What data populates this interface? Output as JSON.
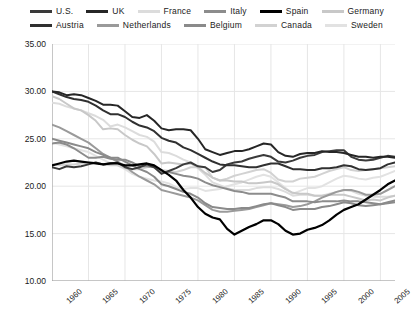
{
  "chart_data": {
    "type": "line",
    "title": "",
    "xlabel": "",
    "ylabel": "Hours per Week per Person",
    "xlim": [
      1960,
      2007
    ],
    "ylim": [
      10,
      35
    ],
    "ytick_labels": [
      "35.00",
      "30.00",
      "25.00",
      "20.00",
      "15.00",
      "10.00"
    ],
    "yticks": [
      35,
      30,
      25,
      20,
      15,
      10
    ],
    "xtick_labels": [
      "1960",
      "1965",
      "1970",
      "1975",
      "1980",
      "1985",
      "1990",
      "1995",
      "2000",
      "2005"
    ],
    "xticks": [
      1960,
      1965,
      1970,
      1975,
      1980,
      1985,
      1990,
      1995,
      2000,
      2005
    ],
    "grid": true,
    "legend_position": "top",
    "x": [
      1960,
      1961,
      1962,
      1963,
      1964,
      1965,
      1966,
      1967,
      1968,
      1969,
      1970,
      1971,
      1972,
      1973,
      1974,
      1975,
      1976,
      1977,
      1978,
      1979,
      1980,
      1981,
      1982,
      1983,
      1984,
      1985,
      1986,
      1987,
      1988,
      1989,
      1990,
      1991,
      1992,
      1993,
      1994,
      1995,
      1996,
      1997,
      1998,
      1999,
      2000,
      2001,
      2002,
      2003,
      2004,
      2005,
      2006,
      2007
    ],
    "series": [
      {
        "name": "U.S.",
        "color": "#3a3a3a",
        "width": 2.0,
        "values": [
          22.0,
          21.8,
          22.1,
          22.0,
          22.1,
          22.3,
          22.5,
          22.3,
          22.4,
          22.5,
          22.0,
          21.8,
          22.0,
          22.3,
          22.0,
          21.3,
          21.6,
          21.9,
          22.3,
          22.5,
          22.1,
          22.0,
          21.5,
          21.7,
          22.3,
          22.5,
          22.6,
          22.9,
          23.1,
          23.3,
          23.1,
          22.6,
          22.5,
          22.7,
          23.0,
          23.2,
          23.3,
          23.6,
          23.7,
          23.8,
          23.8,
          23.1,
          22.8,
          22.7,
          22.8,
          23.0,
          23.2,
          23.1
        ]
      },
      {
        "name": "UK",
        "color": "#262626",
        "width": 2.0,
        "values": [
          30.0,
          29.9,
          29.6,
          29.7,
          29.6,
          29.3,
          29.0,
          28.6,
          28.6,
          28.5,
          27.9,
          27.3,
          27.2,
          27.5,
          26.9,
          26.1,
          25.9,
          26.0,
          26.0,
          25.9,
          25.0,
          23.9,
          23.6,
          23.3,
          23.5,
          23.7,
          23.7,
          23.9,
          24.2,
          24.5,
          24.4,
          23.6,
          23.2,
          23.1,
          23.4,
          23.5,
          23.5,
          23.7,
          23.6,
          23.6,
          23.5,
          23.3,
          23.1,
          23.1,
          23.0,
          23.1,
          23.1,
          23.0
        ]
      },
      {
        "name": "France",
        "color": "#dcdcdc",
        "width": 2.0,
        "values": [
          28.8,
          28.7,
          28.4,
          28.2,
          28.0,
          27.7,
          27.4,
          27.0,
          26.3,
          26.5,
          26.2,
          25.8,
          25.4,
          25.2,
          24.7,
          23.6,
          23.5,
          23.2,
          22.8,
          22.5,
          21.9,
          21.2,
          20.4,
          20.1,
          19.8,
          19.6,
          19.6,
          19.6,
          19.8,
          19.9,
          19.9,
          19.7,
          19.4,
          19.0,
          19.1,
          19.1,
          19.0,
          19.0,
          19.2,
          19.4,
          19.6,
          19.5,
          19.2,
          19.0,
          18.9,
          18.9,
          18.9,
          19.0
        ]
      },
      {
        "name": "Italy",
        "color": "#8c8c8c",
        "width": 2.0,
        "values": [
          24.5,
          24.6,
          24.4,
          24.0,
          23.5,
          23.0,
          23.0,
          23.1,
          22.9,
          22.8,
          22.8,
          22.5,
          22.1,
          22.1,
          22.0,
          21.5,
          21.5,
          21.3,
          21.1,
          21.0,
          20.8,
          20.4,
          20.1,
          19.9,
          19.7,
          19.5,
          19.4,
          19.2,
          19.2,
          19.2,
          19.2,
          19.0,
          18.8,
          18.4,
          18.4,
          18.4,
          18.3,
          18.4,
          18.4,
          18.4,
          18.5,
          18.4,
          18.4,
          18.3,
          18.2,
          18.1,
          18.2,
          18.3
        ]
      },
      {
        "name": "Spain",
        "color": "#000000",
        "width": 2.2,
        "values": [
          22.2,
          22.4,
          22.6,
          22.7,
          22.6,
          22.5,
          22.4,
          22.3,
          22.4,
          22.4,
          22.2,
          22.2,
          22.3,
          22.4,
          22.2,
          21.7,
          21.2,
          20.6,
          19.6,
          18.8,
          17.8,
          17.1,
          16.7,
          16.5,
          15.5,
          14.9,
          15.3,
          15.7,
          16.0,
          16.4,
          16.4,
          16.0,
          15.3,
          14.9,
          15.0,
          15.4,
          15.6,
          15.9,
          16.4,
          17.0,
          17.5,
          17.8,
          18.1,
          18.6,
          19.1,
          19.6,
          20.2,
          20.6
        ]
      },
      {
        "name": "Germany",
        "color": "#c8c8c8",
        "width": 2.0,
        "values": [
          29.5,
          29.2,
          28.7,
          28.2,
          28.0,
          27.5,
          26.9,
          26.0,
          26.1,
          26.0,
          25.4,
          24.9,
          24.5,
          24.2,
          23.4,
          22.4,
          22.5,
          22.4,
          22.3,
          22.4,
          22.0,
          21.4,
          20.9,
          20.6,
          20.6,
          20.5,
          20.5,
          20.3,
          20.3,
          20.4,
          20.5,
          20.2,
          19.7,
          19.3,
          19.2,
          19.2,
          19.0,
          19.0,
          19.1,
          19.1,
          19.1,
          18.9,
          18.7,
          18.5,
          18.6,
          18.5,
          18.8,
          19.0
        ]
      },
      {
        "name": "Austria",
        "color": "#303030",
        "width": 2.0,
        "values": [
          30.0,
          29.7,
          29.4,
          29.2,
          29.1,
          28.9,
          28.5,
          28.0,
          27.6,
          27.6,
          27.3,
          26.8,
          26.4,
          26.2,
          25.8,
          25.1,
          24.8,
          24.6,
          24.1,
          23.8,
          23.4,
          23.0,
          22.6,
          22.3,
          22.2,
          22.2,
          22.1,
          22.0,
          22.0,
          22.2,
          22.4,
          22.4,
          22.1,
          21.8,
          21.8,
          21.7,
          21.7,
          21.9,
          21.9,
          22.0,
          22.2,
          22.1,
          21.8,
          21.7,
          21.8,
          21.9,
          22.3,
          22.5
        ]
      },
      {
        "name": "Netherlands",
        "color": "#9a9a9a",
        "width": 2.0,
        "values": [
          26.5,
          26.2,
          25.8,
          25.4,
          25.0,
          24.6,
          24.0,
          23.4,
          23.0,
          22.6,
          22.1,
          21.5,
          21.0,
          20.6,
          20.2,
          19.6,
          19.4,
          19.2,
          19.0,
          18.8,
          18.5,
          18.0,
          17.5,
          17.3,
          17.3,
          17.4,
          17.5,
          17.6,
          17.8,
          18.0,
          18.2,
          18.1,
          18.0,
          17.8,
          17.9,
          18.1,
          18.4,
          18.8,
          19.1,
          19.4,
          19.6,
          19.6,
          19.4,
          19.1,
          19.1,
          19.2,
          19.6,
          20.0
        ]
      },
      {
        "name": "Belgium",
        "color": "#8a8a8a",
        "width": 2.0,
        "values": [
          25.0,
          24.8,
          24.6,
          24.4,
          24.2,
          24.0,
          23.6,
          23.3,
          23.0,
          23.0,
          22.6,
          22.2,
          21.8,
          21.5,
          21.0,
          20.2,
          20.0,
          19.7,
          19.4,
          19.2,
          18.8,
          18.2,
          17.8,
          17.7,
          17.6,
          17.6,
          17.7,
          17.7,
          17.9,
          18.1,
          18.2,
          18.0,
          17.8,
          17.5,
          17.6,
          17.6,
          17.6,
          17.8,
          17.9,
          18.1,
          18.3,
          18.2,
          18.0,
          17.9,
          18.0,
          18.1,
          18.3,
          18.5
        ]
      },
      {
        "name": "Canada",
        "color": "#d2d2d2",
        "width": 2.0,
        "values": [
          22.3,
          22.2,
          22.3,
          22.3,
          22.4,
          22.5,
          22.5,
          22.3,
          22.2,
          22.2,
          21.9,
          21.8,
          21.8,
          22.0,
          22.1,
          21.7,
          21.6,
          21.5,
          21.7,
          22.0,
          22.0,
          22.0,
          20.9,
          20.6,
          20.8,
          21.1,
          21.3,
          21.5,
          21.7,
          21.8,
          21.4,
          20.7,
          20.5,
          20.5,
          20.8,
          20.9,
          21.0,
          21.3,
          21.6,
          21.8,
          22.0,
          21.7,
          21.6,
          21.7,
          21.8,
          21.9,
          22.0,
          22.1
        ]
      },
      {
        "name": "Sweden",
        "color": "#e2e2e2",
        "width": 2.0,
        "values": [
          24.6,
          24.4,
          24.2,
          24.0,
          23.8,
          23.6,
          23.2,
          22.8,
          22.4,
          22.2,
          21.8,
          21.3,
          21.0,
          20.8,
          20.6,
          20.5,
          20.3,
          19.9,
          19.7,
          19.8,
          19.8,
          19.5,
          19.6,
          19.7,
          20.0,
          20.2,
          20.4,
          20.7,
          21.0,
          21.2,
          21.0,
          20.4,
          19.8,
          19.2,
          19.5,
          19.8,
          19.8,
          20.0,
          20.4,
          20.8,
          21.1,
          21.0,
          20.8,
          20.7,
          20.9,
          21.0,
          21.3,
          21.6
        ]
      }
    ]
  },
  "legend": {
    "rows": [
      [
        {
          "label": "U.S.",
          "color": "#3a3a3a"
        },
        {
          "label": "UK",
          "color": "#262626"
        },
        {
          "label": "France",
          "color": "#dcdcdc"
        },
        {
          "label": "Italy",
          "color": "#8c8c8c"
        },
        {
          "label": "Spain",
          "color": "#000000"
        },
        {
          "label": "Germany",
          "color": "#c8c8c8"
        }
      ],
      [
        {
          "label": "Austria",
          "color": "#303030"
        },
        {
          "label": "Netherlands",
          "color": "#9a9a9a"
        },
        {
          "label": "Belgium",
          "color": "#8a8a8a"
        },
        {
          "label": "Canada",
          "color": "#d2d2d2"
        },
        {
          "label": "Sweden",
          "color": "#e2e2e2"
        }
      ]
    ]
  },
  "axes": {
    "y_title": "Hours per Week per Person"
  },
  "style": {
    "grid_color": "#e6e6e6",
    "axis_color": "#999999",
    "background": "#ffffff"
  }
}
